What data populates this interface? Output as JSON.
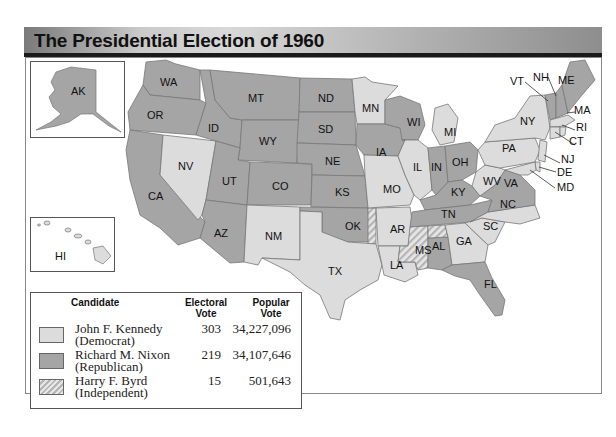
{
  "title": "The Presidential Election of 1960",
  "colors": {
    "democrat": "#dcdcdc",
    "republican": "#a5a5a5",
    "independent_hatch": [
      "#e6e6e6",
      "#b4b4b4"
    ],
    "title_bar_border": "#1a1a1a"
  },
  "insets": {
    "alaska": {
      "label": "AK"
    },
    "hawaii": {
      "label": "HI"
    }
  },
  "states": {
    "WA": {
      "label": "WA",
      "party": "republican"
    },
    "OR": {
      "label": "OR",
      "party": "republican"
    },
    "CA": {
      "label": "CA",
      "party": "republican"
    },
    "NV": {
      "label": "NV",
      "party": "democrat"
    },
    "ID": {
      "label": "ID",
      "party": "republican"
    },
    "MT": {
      "label": "MT",
      "party": "republican"
    },
    "WY": {
      "label": "WY",
      "party": "republican"
    },
    "UT": {
      "label": "UT",
      "party": "republican"
    },
    "CO": {
      "label": "CO",
      "party": "republican"
    },
    "AZ": {
      "label": "AZ",
      "party": "republican"
    },
    "NM": {
      "label": "NM",
      "party": "democrat"
    },
    "ND": {
      "label": "ND",
      "party": "republican"
    },
    "SD": {
      "label": "SD",
      "party": "republican"
    },
    "NE": {
      "label": "NE",
      "party": "republican"
    },
    "KS": {
      "label": "KS",
      "party": "republican"
    },
    "OK": {
      "label": "OK",
      "party": "republican"
    },
    "TX": {
      "label": "TX",
      "party": "democrat"
    },
    "MN": {
      "label": "MN",
      "party": "democrat"
    },
    "IA": {
      "label": "IA",
      "party": "republican"
    },
    "MO": {
      "label": "MO",
      "party": "democrat"
    },
    "AR": {
      "label": "AR",
      "party": "democrat"
    },
    "LA": {
      "label": "LA",
      "party": "democrat"
    },
    "WI": {
      "label": "WI",
      "party": "republican"
    },
    "IL": {
      "label": "IL",
      "party": "democrat"
    },
    "MI": {
      "label": "MI",
      "party": "democrat"
    },
    "IN": {
      "label": "IN",
      "party": "republican"
    },
    "OH": {
      "label": "OH",
      "party": "republican"
    },
    "KY": {
      "label": "KY",
      "party": "republican"
    },
    "TN": {
      "label": "TN",
      "party": "republican"
    },
    "MS": {
      "label": "MS",
      "party": "independent"
    },
    "AL": {
      "label": "AL",
      "party": "split"
    },
    "GA": {
      "label": "GA",
      "party": "democrat"
    },
    "FL": {
      "label": "FL",
      "party": "republican"
    },
    "SC": {
      "label": "SC",
      "party": "democrat"
    },
    "NC": {
      "label": "NC",
      "party": "democrat"
    },
    "VA": {
      "label": "VA",
      "party": "republican"
    },
    "WV": {
      "label": "WV",
      "party": "democrat"
    },
    "PA": {
      "label": "PA",
      "party": "democrat"
    },
    "NY": {
      "label": "NY",
      "party": "democrat"
    },
    "VT": {
      "label": "VT",
      "party": "republican"
    },
    "NH": {
      "label": "NH",
      "party": "republican"
    },
    "ME": {
      "label": "ME",
      "party": "republican"
    },
    "MA": {
      "label": "MA",
      "party": "democrat"
    },
    "RI": {
      "label": "RI",
      "party": "democrat"
    },
    "CT": {
      "label": "CT",
      "party": "democrat"
    },
    "NJ": {
      "label": "NJ",
      "party": "democrat"
    },
    "DE": {
      "label": "DE",
      "party": "democrat"
    },
    "MD": {
      "label": "MD",
      "party": "democrat"
    }
  },
  "legend": {
    "headers": {
      "candidate": "Candidate",
      "electoral_1": "Electoral",
      "electoral_2": "Vote",
      "popular_1": "Popular",
      "popular_2": "Vote"
    },
    "rows": [
      {
        "name": "John F. Kennedy",
        "party": "(Democrat)",
        "electoral": "303",
        "popular": "34,227,096",
        "swatch": "democrat"
      },
      {
        "name": "Richard M. Nixon",
        "party": "(Republican)",
        "electoral": "219",
        "popular": "34,107,646",
        "swatch": "republican"
      },
      {
        "name": "Harry F. Byrd",
        "party": "(Independent)",
        "electoral": "15",
        "popular": "501,643",
        "swatch": "independent"
      }
    ]
  }
}
